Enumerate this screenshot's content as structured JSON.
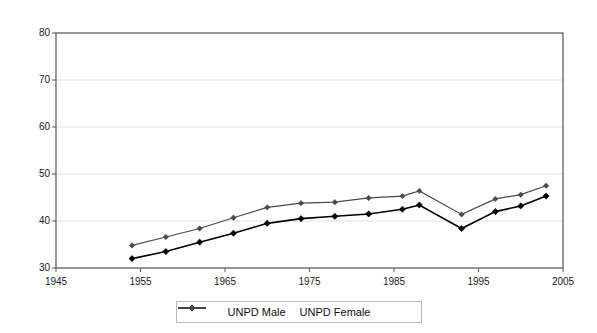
{
  "chart_data": {
    "type": "line",
    "title": "",
    "xlabel": "",
    "ylabel": "",
    "xlim": [
      1945,
      2005
    ],
    "ylim": [
      30,
      80
    ],
    "xticks": [
      1945,
      1955,
      1965,
      1975,
      1985,
      1995,
      2005
    ],
    "xtick_labels": [
      "1945",
      "1955",
      "1965",
      "1975",
      "1985",
      "1995",
      "2005"
    ],
    "yticks": [
      30,
      40,
      50,
      60,
      70,
      80
    ],
    "ytick_labels": [
      "30",
      "40",
      "50",
      "60",
      "70",
      "80"
    ],
    "grid": true,
    "grid_axis": "y",
    "legend_position": "bottom",
    "x": [
      1954,
      1957,
      1960,
      1963,
      1966,
      1969,
      1972,
      1975,
      1978,
      1981,
      1984,
      1987,
      1993,
      1997,
      2000,
      2003
    ],
    "series": [
      {
        "name": "UNPD Male",
        "color": "#000000",
        "marker": "diamond",
        "x": [
          1954,
          1958,
          1962,
          1966,
          1970,
          1974,
          1978,
          1982,
          1986,
          1988,
          1993,
          1997,
          2000,
          2003
        ],
        "values": [
          32.0,
          33.5,
          35.5,
          37.4,
          39.5,
          40.5,
          41.0,
          41.5,
          42.5,
          43.4,
          38.4,
          42.0,
          43.2,
          45.3
        ]
      },
      {
        "name": "UNPD Female",
        "color": "#4a4a4a",
        "marker": "diamond",
        "x": [
          1954,
          1958,
          1962,
          1966,
          1970,
          1974,
          1978,
          1982,
          1986,
          1988,
          1993,
          1997,
          2000,
          2003
        ],
        "values": [
          34.8,
          36.6,
          38.4,
          40.7,
          42.9,
          43.8,
          44.0,
          44.9,
          45.3,
          46.4,
          41.4,
          44.7,
          45.6,
          47.5
        ]
      }
    ],
    "legend": [
      {
        "label": "UNPD Male",
        "color": "#000000",
        "marker": "diamond"
      },
      {
        "label": "UNPD Female",
        "color": "#4a4a4a",
        "marker": "diamond"
      }
    ]
  }
}
